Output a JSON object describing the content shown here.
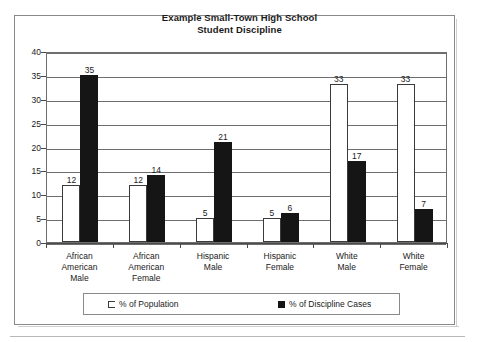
{
  "chart_data": {
    "type": "bar",
    "title": "Example Small-Town High School Student Discipline",
    "title_line1": "Example Small-Town High School",
    "title_line2": "Student Discipline",
    "xlabel": "",
    "ylabel": "",
    "ylim": [
      0,
      40
    ],
    "ytick_step": 5,
    "yticks": [
      "40",
      "35",
      "30",
      "25",
      "20",
      "15",
      "10",
      "5",
      "0"
    ],
    "grid": true,
    "legend_position": "bottom",
    "categories": [
      "African American Male",
      "African American Female",
      "Hispanic Male",
      "Hispanic Female",
      "White Male",
      "White Female"
    ],
    "category_lines": [
      [
        "African",
        "American",
        "Male"
      ],
      [
        "African",
        "American",
        "Female"
      ],
      [
        "Hispanic",
        "Male"
      ],
      [
        "Hispanic",
        "Female"
      ],
      [
        "White",
        "Male"
      ],
      [
        "White",
        "Female"
      ]
    ],
    "series": [
      {
        "name": "% of Population",
        "color": "#ffffff",
        "values": [
          12,
          12,
          5,
          5,
          33,
          33
        ],
        "labels": [
          "12",
          "12",
          "5",
          "5",
          "33",
          "33"
        ]
      },
      {
        "name": "% of Discipline Cases",
        "color": "#151515",
        "values": [
          35,
          14,
          21,
          6,
          17,
          7
        ],
        "labels": [
          "35",
          "14",
          "21",
          "6",
          "17",
          "7"
        ]
      }
    ]
  },
  "legend": {
    "entries": [
      {
        "label": "% of Population",
        "swatch": "hollow-square-icon"
      },
      {
        "label": "% of Discipline Cases",
        "swatch": "filled-square-icon"
      }
    ]
  }
}
